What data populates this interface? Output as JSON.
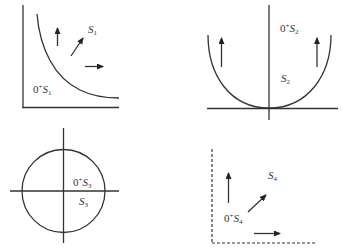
{
  "panels": [
    {
      "id": "panel-1",
      "outer_label": {
        "prefix": "0",
        "sup": "+",
        "base": "S",
        "sub": "1"
      },
      "region_label": {
        "base": "S",
        "sub": "1"
      },
      "shape": "hyperbola-like decreasing curve in first quadrant",
      "arrows": [
        "up",
        "diagonal up-right",
        "right"
      ],
      "axes": "solid"
    },
    {
      "id": "panel-2",
      "outer_label": {
        "prefix": "0",
        "sup": "+",
        "base": "S",
        "sub": "2"
      },
      "region_label": {
        "base": "S",
        "sub": "2"
      },
      "shape": "parabola opening upward tangent at origin",
      "arrows": [
        "up",
        "up"
      ],
      "axes": "solid"
    },
    {
      "id": "panel-3",
      "outer_label": {
        "prefix": "0",
        "sup": "+",
        "base": "S",
        "sub": "3"
      },
      "region_label": {
        "base": "S",
        "sub": "3"
      },
      "shape": "circle centered at origin",
      "arrows": [],
      "axes": "solid"
    },
    {
      "id": "panel-4",
      "outer_label": {
        "prefix": "0",
        "sup": "+",
        "base": "S",
        "sub": "4"
      },
      "region_label": {
        "base": "S",
        "sub": "4"
      },
      "shape": "first quadrant (dashed boundary)",
      "arrows": [
        "up",
        "diagonal up-right",
        "right"
      ],
      "axes": "dashed"
    }
  ],
  "colors": {
    "stroke": "#333333",
    "background": "#ffffff"
  }
}
